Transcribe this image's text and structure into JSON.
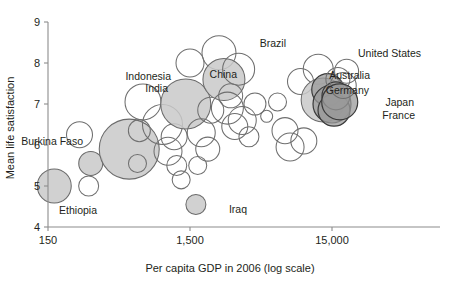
{
  "chart_data": {
    "type": "scatter",
    "title": "",
    "xlabel": "Per capita GDP in 2006 (log scale)",
    "ylabel": "Mean life satisfaction",
    "xscale": "log",
    "xlim": [
      150,
      40000
    ],
    "ylim": [
      4,
      9
    ],
    "xticks": [
      150,
      1500,
      15000
    ],
    "xticklabels": [
      "150",
      "1,500",
      "15,000"
    ],
    "yticks": [
      4,
      5,
      6,
      7,
      8,
      9
    ],
    "yticklabels": [
      "4",
      "5",
      "6",
      "7",
      "8",
      "9"
    ],
    "grid": false,
    "legend": false,
    "bubble_encoding": "population",
    "annotations": [
      {
        "label": "Indonesia",
        "x": 171,
        "y": 79.5
      },
      {
        "label": "China",
        "x": 237,
        "y": 78
      },
      {
        "label": "Brazil",
        "x": 286,
        "y": 47
      },
      {
        "label": "India",
        "x": 168,
        "y": 92
      },
      {
        "label": "Burkina Faso",
        "x": 83,
        "y": 145
      },
      {
        "label": "Ethiopia",
        "x": 97,
        "y": 214
      },
      {
        "label": "Iraq",
        "x": 247,
        "y": 213
      },
      {
        "label": "Australia",
        "x": 370,
        "y": 79
      },
      {
        "label": "Germany",
        "x": 369,
        "y": 94
      },
      {
        "label": "United States",
        "x": 421,
        "y": 57
      },
      {
        "label": "Japan",
        "x": 414,
        "y": 106
      },
      {
        "label": "France",
        "x": 415,
        "y": 119
      }
    ],
    "points": [
      {
        "name": "",
        "gdp": 166,
        "life": 5.0,
        "r": 17,
        "style": "fill"
      },
      {
        "name": "",
        "gdp": 290,
        "life": 5.0,
        "r": 10,
        "style": "open"
      },
      {
        "name": "",
        "gdp": 300,
        "life": 5.55,
        "r": 12,
        "style": "fill"
      },
      {
        "name": "",
        "gdp": 250,
        "life": 6.25,
        "r": 13,
        "style": "open"
      },
      {
        "name": "",
        "gdp": 560,
        "life": 5.9,
        "r": 30,
        "style": "fill"
      },
      {
        "name": "",
        "gdp": 660,
        "life": 6.35,
        "r": 11,
        "style": "open"
      },
      {
        "name": "",
        "gdp": 640,
        "life": 5.55,
        "r": 9,
        "style": "open"
      },
      {
        "name": "",
        "gdp": 700,
        "life": 7.05,
        "r": 18,
        "style": "open"
      },
      {
        "name": "",
        "gdp": 960,
        "life": 6.5,
        "r": 20,
        "style": "open"
      },
      {
        "name": "",
        "gdp": 1050,
        "life": 5.85,
        "r": 14,
        "style": "open"
      },
      {
        "name": "",
        "gdp": 1160,
        "life": 6.2,
        "r": 13,
        "style": "open"
      },
      {
        "name": "",
        "gdp": 1210,
        "life": 5.5,
        "r": 10,
        "style": "open"
      },
      {
        "name": "",
        "gdp": 1300,
        "life": 5.15,
        "r": 9,
        "style": "open"
      },
      {
        "name": "",
        "gdp": 1400,
        "life": 7.0,
        "r": 25,
        "style": "fill"
      },
      {
        "name": "",
        "gdp": 1500,
        "life": 8.0,
        "r": 14,
        "style": "open"
      },
      {
        "name": "",
        "gdp": 1650,
        "life": 4.55,
        "r": 10,
        "style": "fill"
      },
      {
        "name": "",
        "gdp": 1700,
        "life": 5.5,
        "r": 9,
        "style": "open"
      },
      {
        "name": "",
        "gdp": 1800,
        "life": 6.3,
        "r": 14,
        "style": "open"
      },
      {
        "name": "",
        "gdp": 2000,
        "life": 5.9,
        "r": 12,
        "style": "open"
      },
      {
        "name": "",
        "gdp": 2100,
        "life": 6.85,
        "r": 13,
        "style": "open"
      },
      {
        "name": "",
        "gdp": 2400,
        "life": 8.25,
        "r": 17,
        "style": "open"
      },
      {
        "name": "",
        "gdp": 2600,
        "life": 7.6,
        "r": 21,
        "style": "fill"
      },
      {
        "name": "",
        "gdp": 2750,
        "life": 6.9,
        "r": 16,
        "style": "open"
      },
      {
        "name": "",
        "gdp": 2900,
        "life": 7.2,
        "r": 12,
        "style": "open"
      },
      {
        "name": "",
        "gdp": 3100,
        "life": 6.45,
        "r": 13,
        "style": "open"
      },
      {
        "name": "",
        "gdp": 3300,
        "life": 7.85,
        "r": 16,
        "style": "open"
      },
      {
        "name": "",
        "gdp": 3500,
        "life": 6.6,
        "r": 14,
        "style": "open"
      },
      {
        "name": "",
        "gdp": 3900,
        "life": 6.2,
        "r": 10,
        "style": "open"
      },
      {
        "name": "",
        "gdp": 4300,
        "life": 7.0,
        "r": 11,
        "style": "open"
      },
      {
        "name": "",
        "gdp": 5200,
        "life": 6.7,
        "r": 6,
        "style": "open"
      },
      {
        "name": "",
        "gdp": 6200,
        "life": 7.05,
        "r": 9,
        "style": "open"
      },
      {
        "name": "",
        "gdp": 7000,
        "life": 6.35,
        "r": 13,
        "style": "open"
      },
      {
        "name": "",
        "gdp": 7600,
        "life": 5.95,
        "r": 14,
        "style": "open"
      },
      {
        "name": "",
        "gdp": 9000,
        "life": 7.55,
        "r": 13,
        "style": "open"
      },
      {
        "name": "",
        "gdp": 9500,
        "life": 6.1,
        "r": 13,
        "style": "open"
      },
      {
        "name": "",
        "gdp": 12000,
        "life": 7.85,
        "r": 15,
        "style": "open"
      },
      {
        "name": "",
        "gdp": 13000,
        "life": 7.1,
        "r": 22,
        "style": "fill"
      },
      {
        "name": "",
        "gdp": 14000,
        "life": 7.35,
        "r": 16,
        "style": "dark"
      },
      {
        "name": "",
        "gdp": 15000,
        "life": 7.0,
        "r": 19,
        "style": "dark"
      },
      {
        "name": "",
        "gdp": 15500,
        "life": 6.85,
        "r": 16,
        "style": "dark"
      },
      {
        "name": "",
        "gdp": 16000,
        "life": 7.2,
        "r": 14,
        "style": "dark"
      },
      {
        "name": "",
        "gdp": 16500,
        "life": 7.6,
        "r": 12,
        "style": "open"
      },
      {
        "name": "",
        "gdp": 17000,
        "life": 7.05,
        "r": 18,
        "style": "dark"
      },
      {
        "name": "",
        "gdp": 18000,
        "life": 7.45,
        "r": 13,
        "style": "open"
      },
      {
        "name": "",
        "gdp": 19000,
        "life": 7.8,
        "r": 12,
        "style": "open"
      }
    ]
  },
  "axes": {
    "x_title": "Per capita GDP in 2006 (log scale)",
    "y_title": "Mean life satisfaction"
  }
}
